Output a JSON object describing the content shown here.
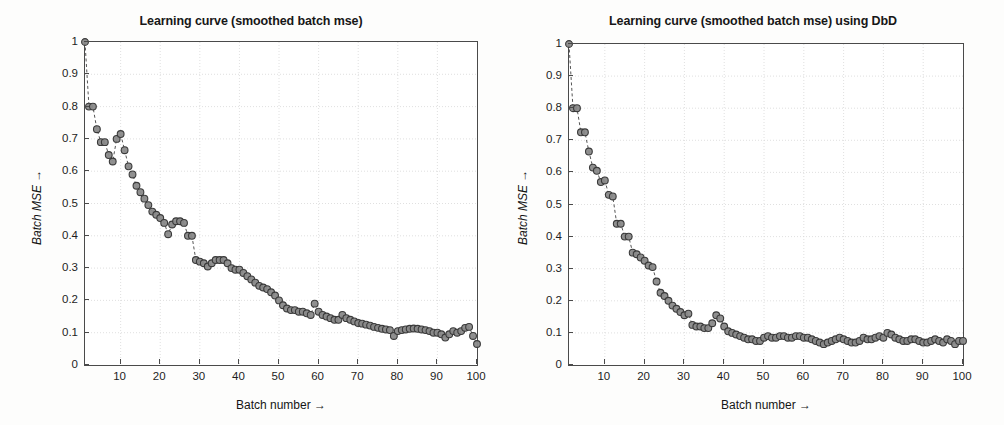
{
  "figure": {
    "background": "#fdfdfc",
    "axis_color": "#4a4a4a",
    "grid_color": "#d8d8d8",
    "marker_edge": "#3a3a3a",
    "marker_fill": "#8a8a8a",
    "line_color": "#555555"
  },
  "chart_data": [
    {
      "id": "left",
      "type": "line",
      "title": "Learning curve (smoothed batch mse)",
      "xlabel": "Batch number →",
      "ylabel": "Batch MSE →",
      "xlim": [
        1,
        100
      ],
      "ylim": [
        0,
        1
      ],
      "grid": true,
      "legend": "none",
      "marker": "circle",
      "linestyle": "dashed",
      "xticks": [
        10,
        20,
        30,
        40,
        50,
        60,
        70,
        80,
        90,
        100
      ],
      "xticklabels": [
        "10",
        "20",
        "30",
        "40",
        "50",
        "60",
        "70",
        "80",
        "90",
        "100"
      ],
      "yticks": [
        0,
        0.1,
        0.2,
        0.3,
        0.4,
        0.5,
        0.6,
        0.7,
        0.8,
        0.9,
        1
      ],
      "yticklabels": [
        "0",
        "0.1",
        "0.2",
        "0.3",
        "0.4",
        "0.5",
        "0.6",
        "0.7",
        "0.8",
        "0.9",
        "1"
      ],
      "x": [
        1,
        2,
        3,
        4,
        5,
        6,
        7,
        8,
        9,
        10,
        11,
        12,
        13,
        14,
        15,
        16,
        17,
        18,
        19,
        20,
        21,
        22,
        23,
        24,
        25,
        26,
        27,
        28,
        29,
        30,
        31,
        32,
        33,
        34,
        35,
        36,
        37,
        38,
        39,
        40,
        41,
        42,
        43,
        44,
        45,
        46,
        47,
        48,
        49,
        50,
        51,
        52,
        53,
        54,
        55,
        56,
        57,
        58,
        59,
        60,
        61,
        62,
        63,
        64,
        65,
        66,
        67,
        68,
        69,
        70,
        71,
        72,
        73,
        74,
        75,
        76,
        77,
        78,
        79,
        80,
        81,
        82,
        83,
        84,
        85,
        86,
        87,
        88,
        89,
        90,
        91,
        92,
        93,
        94,
        95,
        96,
        97,
        98,
        99,
        100
      ],
      "y": [
        1.0,
        0.8,
        0.8,
        0.73,
        0.69,
        0.69,
        0.65,
        0.63,
        0.7,
        0.715,
        0.665,
        0.615,
        0.59,
        0.555,
        0.535,
        0.515,
        0.495,
        0.475,
        0.465,
        0.455,
        0.44,
        0.405,
        0.435,
        0.445,
        0.445,
        0.44,
        0.4,
        0.4,
        0.325,
        0.32,
        0.315,
        0.305,
        0.315,
        0.325,
        0.325,
        0.325,
        0.315,
        0.3,
        0.295,
        0.295,
        0.285,
        0.275,
        0.265,
        0.255,
        0.245,
        0.24,
        0.235,
        0.225,
        0.215,
        0.2,
        0.185,
        0.175,
        0.17,
        0.17,
        0.165,
        0.165,
        0.16,
        0.155,
        0.19,
        0.165,
        0.155,
        0.15,
        0.145,
        0.14,
        0.14,
        0.155,
        0.145,
        0.14,
        0.135,
        0.13,
        0.128,
        0.125,
        0.122,
        0.118,
        0.115,
        0.112,
        0.11,
        0.108,
        0.09,
        0.105,
        0.108,
        0.11,
        0.112,
        0.113,
        0.112,
        0.11,
        0.108,
        0.105,
        0.1,
        0.1,
        0.095,
        0.085,
        0.095,
        0.105,
        0.1,
        0.105,
        0.115,
        0.118,
        0.09,
        0.065
      ]
    },
    {
      "id": "right",
      "type": "line",
      "title": "Learning curve (smoothed batch mse) using DbD",
      "xlabel": "Batch number →",
      "ylabel": "Batch MSE →",
      "xlim": [
        1,
        100
      ],
      "ylim": [
        0,
        1
      ],
      "grid": true,
      "legend": "none",
      "marker": "circle",
      "linestyle": "dashed",
      "xticks": [
        10,
        20,
        30,
        40,
        50,
        60,
        70,
        80,
        90,
        100
      ],
      "xticklabels": [
        "10",
        "20",
        "30",
        "40",
        "50",
        "60",
        "70",
        "80",
        "90",
        "100"
      ],
      "yticks": [
        0,
        0.1,
        0.2,
        0.3,
        0.4,
        0.5,
        0.6,
        0.7,
        0.8,
        0.9,
        1
      ],
      "yticklabels": [
        "0",
        "0.1",
        "0.2",
        "0.3",
        "0.4",
        "0.5",
        "0.6",
        "0.7",
        "0.8",
        "0.9",
        "1"
      ],
      "x": [
        1,
        2,
        3,
        4,
        5,
        6,
        7,
        8,
        9,
        10,
        11,
        12,
        13,
        14,
        15,
        16,
        17,
        18,
        19,
        20,
        21,
        22,
        23,
        24,
        25,
        26,
        27,
        28,
        29,
        30,
        31,
        32,
        33,
        34,
        35,
        36,
        37,
        38,
        39,
        40,
        41,
        42,
        43,
        44,
        45,
        46,
        47,
        48,
        49,
        50,
        51,
        52,
        53,
        54,
        55,
        56,
        57,
        58,
        59,
        60,
        61,
        62,
        63,
        64,
        65,
        66,
        67,
        68,
        69,
        70,
        71,
        72,
        73,
        74,
        75,
        76,
        77,
        78,
        79,
        80,
        81,
        82,
        83,
        84,
        85,
        86,
        87,
        88,
        89,
        90,
        91,
        92,
        93,
        94,
        95,
        96,
        97,
        98,
        99,
        100
      ],
      "y": [
        1.0,
        0.8,
        0.8,
        0.725,
        0.725,
        0.665,
        0.615,
        0.605,
        0.57,
        0.575,
        0.53,
        0.525,
        0.44,
        0.44,
        0.4,
        0.4,
        0.35,
        0.345,
        0.335,
        0.325,
        0.31,
        0.305,
        0.26,
        0.225,
        0.215,
        0.2,
        0.185,
        0.175,
        0.165,
        0.155,
        0.16,
        0.125,
        0.12,
        0.12,
        0.115,
        0.115,
        0.13,
        0.155,
        0.145,
        0.12,
        0.105,
        0.1,
        0.095,
        0.09,
        0.085,
        0.08,
        0.08,
        0.075,
        0.075,
        0.085,
        0.09,
        0.085,
        0.085,
        0.09,
        0.09,
        0.085,
        0.085,
        0.09,
        0.09,
        0.085,
        0.085,
        0.08,
        0.075,
        0.07,
        0.065,
        0.07,
        0.075,
        0.08,
        0.085,
        0.08,
        0.075,
        0.07,
        0.07,
        0.075,
        0.085,
        0.08,
        0.08,
        0.085,
        0.09,
        0.085,
        0.1,
        0.095,
        0.085,
        0.08,
        0.075,
        0.075,
        0.08,
        0.08,
        0.075,
        0.07,
        0.07,
        0.075,
        0.08,
        0.075,
        0.07,
        0.08,
        0.075,
        0.065,
        0.075,
        0.075
      ]
    }
  ]
}
